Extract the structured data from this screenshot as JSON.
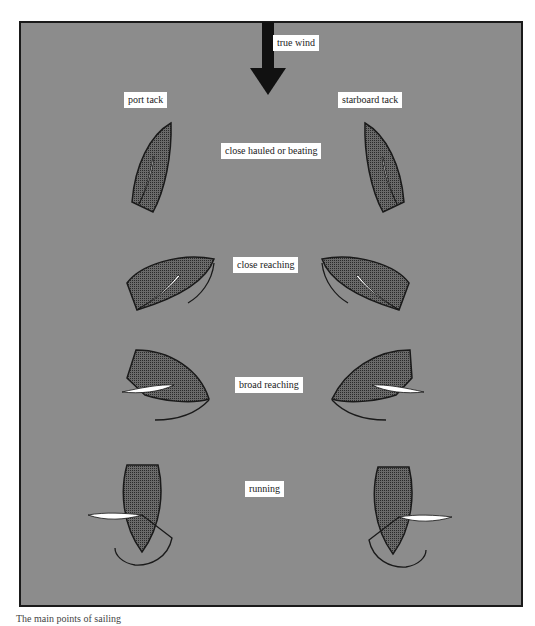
{
  "diagram": {
    "wind_label": "true wind",
    "tack_labels": {
      "port": "port tack",
      "starboard": "starboard tack"
    },
    "points_of_sail": [
      {
        "id": "close-hauled",
        "label": "close hauled or beating"
      },
      {
        "id": "close-reaching",
        "label": "close reaching"
      },
      {
        "id": "broad-reaching",
        "label": "broad reaching"
      },
      {
        "id": "running",
        "label": "running"
      }
    ],
    "colors": {
      "background_pattern": "#cfcfcf",
      "hull_fill": "#555555",
      "outline": "#1a1a1a",
      "sail": "#ffffff",
      "label_bg": "#ffffff"
    }
  },
  "caption": "The main points of sailing"
}
